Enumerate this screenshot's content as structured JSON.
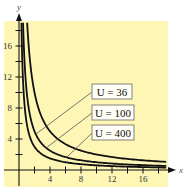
{
  "chart_data": {
    "type": "line",
    "title": "",
    "xlabel": "x",
    "ylabel": "y",
    "xlim": [
      0,
      19.5
    ],
    "ylim": [
      0,
      19.5
    ],
    "x_ticks": [
      2,
      4,
      6,
      8,
      10,
      12,
      14,
      16,
      18
    ],
    "x_tick_labels": [
      "4",
      "8",
      "12",
      "16"
    ],
    "x_tick_label_values": [
      4,
      8,
      12,
      16
    ],
    "y_ticks": [
      2,
      4,
      6,
      8,
      10,
      12,
      14,
      16,
      18
    ],
    "y_tick_labels": [
      "4",
      "8",
      "12",
      "16"
    ],
    "y_tick_label_values": [
      4,
      8,
      12,
      16
    ],
    "grid": false,
    "background_color": "#fdf6b5",
    "curve_color": "#111111",
    "series": [
      {
        "name": "U = 36",
        "formula": "y = 6/x",
        "constant_xy": 6,
        "x": [
          0.33,
          0.5,
          1,
          1.5,
          2,
          3,
          4,
          6,
          8,
          12,
          16,
          18
        ],
        "y": [
          18,
          12,
          6,
          4,
          3,
          2,
          1.5,
          1,
          0.75,
          0.5,
          0.375,
          0.33
        ]
      },
      {
        "name": "U = 100",
        "formula": "y = 10/x",
        "constant_xy": 10,
        "x": [
          0.56,
          1,
          2,
          2.5,
          4,
          5,
          8,
          10,
          12,
          16,
          18
        ],
        "y": [
          18,
          10,
          5,
          4,
          2.5,
          2,
          1.25,
          1,
          0.83,
          0.625,
          0.56
        ]
      },
      {
        "name": "U = 400",
        "formula": "y = 20/x",
        "constant_xy": 20,
        "x": [
          1.11,
          2,
          4,
          5,
          8,
          10,
          12,
          16,
          18
        ],
        "y": [
          18,
          10,
          5,
          4,
          2.5,
          2,
          1.67,
          1.25,
          1.11
        ]
      }
    ],
    "legend": {
      "position": "inline-boxes-center-right",
      "entries": [
        "U = 36",
        "U = 100",
        "U = 400"
      ]
    }
  },
  "labels": {
    "u36": "U = 36",
    "u100": "U = 100",
    "u400": "U = 400",
    "x_axis": "x",
    "y_axis": "y",
    "tick_x_4": "4",
    "tick_x_8": "8",
    "tick_x_12": "12",
    "tick_x_16": "16",
    "tick_y_4": "4",
    "tick_y_8": "8",
    "tick_y_12": "12",
    "tick_y_16": "16"
  }
}
